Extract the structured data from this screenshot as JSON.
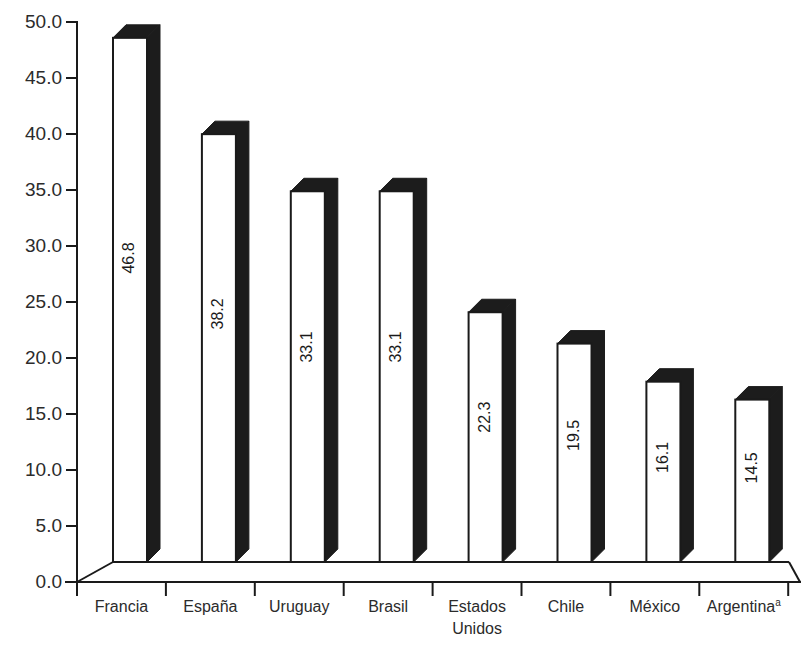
{
  "chart_data": {
    "type": "bar",
    "title": "",
    "subtitle": "",
    "xlabel": "",
    "ylabel": "",
    "categories": [
      "Francia",
      "España",
      "Uruguay",
      "Brasil",
      "Estados Unidos",
      "Chile",
      "México",
      "Argentina"
    ],
    "category_lines": [
      [
        "Francia"
      ],
      [
        "España"
      ],
      [
        "Uruguay"
      ],
      [
        "Brasil"
      ],
      [
        "Estados",
        "Unidos"
      ],
      [
        "Chile"
      ],
      [
        "México"
      ],
      [
        "Argentina"
      ]
    ],
    "category_superscripts": [
      "",
      "",
      "",
      "",
      "",
      "",
      "",
      "a"
    ],
    "values": [
      46.8,
      38.2,
      33.1,
      33.1,
      22.3,
      19.5,
      16.1,
      14.5
    ],
    "value_labels": [
      "46.8",
      "38.2",
      "33.1",
      "33.1",
      "22.3",
      "19.5",
      "16.1",
      "14.5"
    ],
    "ylim": [
      0.0,
      50.0
    ],
    "ytick_values": [
      50.0,
      45.0,
      40.0,
      35.0,
      30.0,
      25.0,
      20.0,
      15.0,
      10.0,
      5.0,
      0.0
    ],
    "ytick_labels": [
      "50.0",
      "45.0",
      "40.0",
      "35.0",
      "30.0",
      "25.0",
      "20.0",
      "15.0",
      "10.0",
      "5.0",
      "0.0"
    ],
    "grid": false,
    "legend": false,
    "legend_position": "none",
    "style": "3d-columns",
    "bar_face_color": "#ffffff",
    "bar_side_color": "#1c1c1c",
    "outline_color": "#1a1a1a",
    "background_color": "#ffffff",
    "value_label_rotation": -90,
    "value_label_position": "inside-bar"
  }
}
